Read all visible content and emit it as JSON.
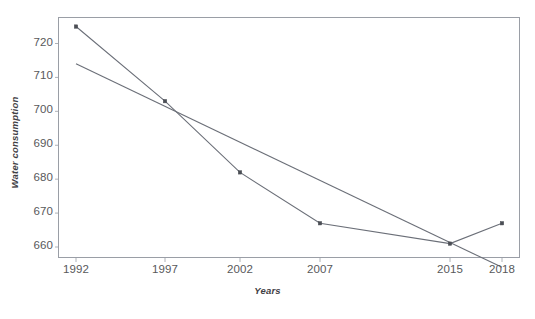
{
  "chart_data": {
    "type": "line",
    "title": "",
    "xlabel": "Years",
    "ylabel": "Water consumption",
    "categories": [
      "1992",
      "1997",
      "2002",
      "2007",
      "2015",
      "2018"
    ],
    "x": [
      1992,
      1997,
      2002,
      2007,
      2015,
      2018
    ],
    "xlim": [
      1991,
      2019
    ],
    "ylim": [
      655,
      729
    ],
    "yticks": [
      660,
      670,
      680,
      690,
      700,
      710,
      720
    ],
    "ytick_labels": [
      "660",
      "670",
      "680",
      "690",
      "700",
      "710",
      "720"
    ],
    "grid": false,
    "legend": "none",
    "series": [
      {
        "name": "Water consumption",
        "type": "line",
        "markers": true,
        "color": "#6b6f78",
        "values": [
          725,
          703,
          682,
          667,
          661,
          667
        ]
      },
      {
        "name": "Linear trend",
        "type": "trendline",
        "markers": false,
        "color": "#6b6f78",
        "endpoints": [
          {
            "x": 1992,
            "y": 714
          },
          {
            "x": 2018,
            "y": 654
          }
        ]
      }
    ],
    "colors": {
      "line": "#6b6f78",
      "marker": "#4b4e55",
      "frame": "#9a9ea6",
      "tick_text": "#58595b",
      "axis_title_text": "#3f4044",
      "background": "#ffffff"
    }
  },
  "axes": {
    "y_title": "Water consumption",
    "x_title": "Years",
    "y_tick_labels": [
      "720",
      "710",
      "700",
      "690",
      "680",
      "670",
      "660"
    ],
    "x_tick_labels": [
      "1992",
      "1997",
      "2002",
      "2007",
      "2015",
      "2018"
    ]
  },
  "caption": {
    "partial_text": ""
  }
}
